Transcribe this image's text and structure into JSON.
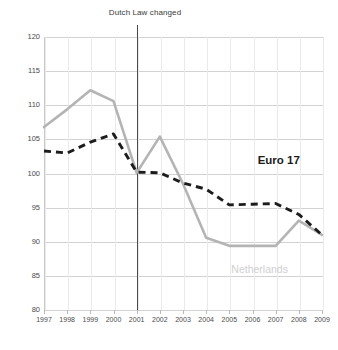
{
  "chart_data": {
    "type": "line",
    "title": "Dutch Law changed",
    "xlabel": "",
    "ylabel": "",
    "x": [
      1997,
      1998,
      1999,
      2000,
      2001,
      2002,
      2003,
      2004,
      2005,
      2006,
      2007,
      2008,
      2009
    ],
    "categories": [
      "1997",
      "1998",
      "1999",
      "2000",
      "2001",
      "2002",
      "2003",
      "2004",
      "2005",
      "2006",
      "2007",
      "2008",
      "2009"
    ],
    "ylim": [
      80,
      120
    ],
    "xlim": [
      1997,
      2009
    ],
    "yticks": [
      80,
      85,
      90,
      95,
      100,
      105,
      110,
      115,
      120
    ],
    "ytick_labels": [
      "80",
      "85",
      "90",
      "95",
      "100",
      "105",
      "110",
      "115",
      "120"
    ],
    "grid": true,
    "legend_position": "inline-annotations",
    "series": [
      {
        "name": "Netherlands",
        "color": "#b4b4b4",
        "style": "solid",
        "values": [
          106.8,
          109.4,
          112.2,
          110.6,
          100.1,
          105.4,
          98.5,
          90.6,
          89.4,
          89.4,
          89.4,
          93.1,
          91.0
        ]
      },
      {
        "name": "Euro 17",
        "color": "#1c1c1c",
        "style": "dashed",
        "values": [
          103.3,
          103.0,
          104.6,
          105.8,
          100.2,
          100.1,
          98.6,
          97.7,
          95.4,
          95.5,
          95.6,
          94.0,
          91.0
        ]
      }
    ],
    "annotations": [
      {
        "name": "event-marker",
        "label": "Dutch Law changed",
        "x": 2001,
        "type": "vertical-line"
      },
      {
        "name": "series-label-euro17",
        "label": "Euro 17",
        "x": 2007,
        "y": 100.2
      },
      {
        "name": "series-label-netherlands",
        "label": "Netherlands",
        "x": 2005.2,
        "y": 86.0
      }
    ]
  },
  "colors": {
    "netherlands": "#b4b4b4",
    "euro17": "#1c1c1c",
    "grid": "#d2d2d2",
    "axis": "#c9c9c9",
    "marker": "#4a4a4a",
    "background": "#ffffff"
  }
}
